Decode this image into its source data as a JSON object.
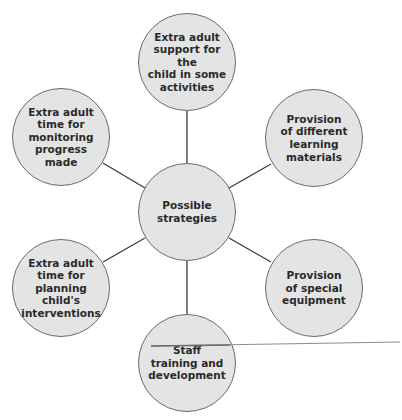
{
  "diagram": {
    "type": "mind-map",
    "center": {
      "label": "Possible\nstrategies"
    },
    "nodes": [
      {
        "id": "top",
        "label": "Extra adult\nsupport for the\nchild in some\nactivities"
      },
      {
        "id": "top-right",
        "label": "Provision\nof different\nlearning\nmaterials"
      },
      {
        "id": "bottom-right",
        "label": "Provision\nof special\nequipment"
      },
      {
        "id": "bottom",
        "label": "Staff\ntraining and\ndevelopment"
      },
      {
        "id": "bottom-left",
        "label": "Extra adult\ntime for\nplanning child's\ninterventions"
      },
      {
        "id": "top-left",
        "label": "Extra adult\ntime for\nmonitoring\nprogress made"
      }
    ],
    "colors": {
      "node_fill": "#e4e4e4",
      "node_stroke": "#6a6a6a",
      "connector": "#3a3a3a",
      "stray_line": "#8c8c8c",
      "text": "#2a2a2a"
    }
  }
}
